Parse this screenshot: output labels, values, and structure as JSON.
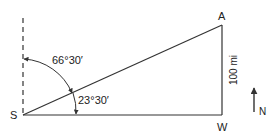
{
  "diagram": {
    "type": "navigation-triangle",
    "points": {
      "S": "S",
      "A": "A",
      "W": "W"
    },
    "angles": {
      "from_north": "66°30′",
      "from_east": "23°30′"
    },
    "side_label": "100 mi",
    "compass": {
      "label": "N"
    },
    "colors": {
      "line": "#333333",
      "text": "#222222",
      "background": "#ffffff"
    }
  }
}
